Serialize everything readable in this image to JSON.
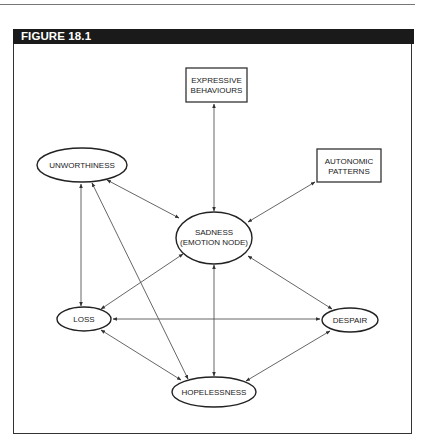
{
  "figure": {
    "title": "FIGURE 18.1",
    "border_color": "#333333",
    "header_bg": "#1a1a1a",
    "header_text_color": "#ffffff"
  },
  "nodes": {
    "expressive": {
      "shape": "rect",
      "line1": "EXPRESSIVE",
      "line2": "BEHAVIOURS"
    },
    "autonomic": {
      "shape": "rect",
      "line1": "AUTONOMIC",
      "line2": "PATTERNS"
    },
    "unworthiness": {
      "shape": "ellipse",
      "label": "UNWORTHINESS"
    },
    "sadness": {
      "shape": "ellipse",
      "line1": "SADNESS",
      "line2": "(EMOTION NODE)"
    },
    "loss": {
      "shape": "ellipse",
      "label": "LOSS"
    },
    "despair": {
      "shape": "ellipse",
      "label": "DESPAIR"
    },
    "hopelessness": {
      "shape": "ellipse",
      "label": "HOPELESSNESS"
    }
  },
  "edges": [
    {
      "from": "expressive",
      "to": "sadness",
      "type": "bidirectional"
    },
    {
      "from": "autonomic",
      "to": "sadness",
      "type": "bidirectional"
    },
    {
      "from": "unworthiness",
      "to": "sadness",
      "type": "bidirectional"
    },
    {
      "from": "unworthiness",
      "to": "loss",
      "type": "bidirectional"
    },
    {
      "from": "unworthiness",
      "to": "hopelessness",
      "type": "bidirectional"
    },
    {
      "from": "sadness",
      "to": "loss",
      "type": "bidirectional"
    },
    {
      "from": "sadness",
      "to": "despair",
      "type": "bidirectional"
    },
    {
      "from": "sadness",
      "to": "hopelessness",
      "type": "bidirectional"
    },
    {
      "from": "loss",
      "to": "despair",
      "type": "bidirectional"
    },
    {
      "from": "loss",
      "to": "hopelessness",
      "type": "bidirectional"
    },
    {
      "from": "despair",
      "to": "hopelessness",
      "type": "bidirectional"
    }
  ]
}
